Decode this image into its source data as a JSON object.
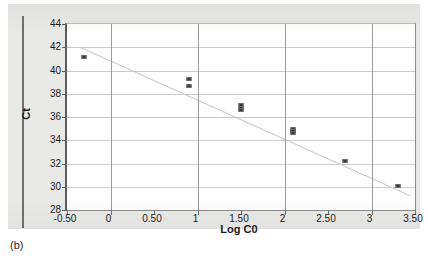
{
  "caption": "(b)",
  "chart_data": {
    "type": "scatter",
    "title": "",
    "xlabel": "Log C0",
    "ylabel": "Ct",
    "xlim": [
      -0.5,
      3.5
    ],
    "ylim": [
      28,
      44
    ],
    "grid": true,
    "legend": "none",
    "xticks": [
      "-0.50",
      "0",
      "0.50",
      "1",
      "1.50",
      "2",
      "2.50",
      "3",
      "3.50"
    ],
    "xtick_values": [
      -0.5,
      0,
      0.5,
      1,
      1.5,
      2,
      2.5,
      3,
      3.5
    ],
    "yticks": [
      "28",
      "30",
      "32",
      "34",
      "36",
      "38",
      "40",
      "42",
      "44"
    ],
    "ytick_values": [
      28,
      30,
      32,
      34,
      36,
      38,
      40,
      42,
      44
    ],
    "x": [
      -0.3,
      0.9,
      0.9,
      1.5,
      1.5,
      1.5,
      2.1,
      2.1,
      2.1,
      2.7,
      3.3
    ],
    "y": [
      41.2,
      39.3,
      38.65,
      37.0,
      36.8,
      36.6,
      35.0,
      34.8,
      34.6,
      32.2,
      30.05
    ],
    "points": [
      {
        "x": -0.3,
        "y": 41.2
      },
      {
        "x": 0.9,
        "y": 39.3
      },
      {
        "x": 0.9,
        "y": 38.65
      },
      {
        "x": 1.5,
        "y": 37.0
      },
      {
        "x": 1.5,
        "y": 36.8
      },
      {
        "x": 1.5,
        "y": 36.6
      },
      {
        "x": 2.1,
        "y": 35.0
      },
      {
        "x": 2.1,
        "y": 34.8
      },
      {
        "x": 2.1,
        "y": 34.6
      },
      {
        "x": 2.7,
        "y": 32.2
      },
      {
        "x": 3.3,
        "y": 30.05
      }
    ],
    "trendline": {
      "type": "line",
      "x": [
        -0.35,
        3.45
      ],
      "y": [
        42.0,
        29.2
      ]
    },
    "marker_color": "#3a3a3a",
    "trendline_color": "#cccccc",
    "grid_color": "#c9c9c9",
    "plot_background": "#ffffff",
    "panel_background": "#e9e9e7"
  }
}
